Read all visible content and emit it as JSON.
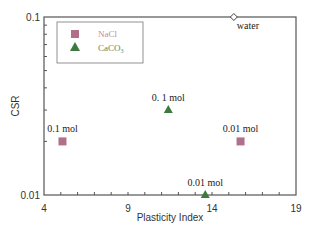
{
  "chart_data": {
    "type": "scatter",
    "title": "",
    "xlabel": "Plasticity Index",
    "ylabel": "CSR",
    "xlim": [
      4,
      19
    ],
    "ylim": [
      0.01,
      0.1
    ],
    "yscale": "log",
    "grid": false,
    "legend_position": "upper-left",
    "x_ticks": [
      4,
      9,
      14,
      19
    ],
    "x_tick_labels": [
      "4",
      "9",
      "14",
      "19"
    ],
    "y_ticks": [
      0.01,
      0.1
    ],
    "y_tick_labels": [
      "0.01",
      "0.1"
    ],
    "series": [
      {
        "name": "NaCl",
        "marker": "square",
        "color": "#b0708a",
        "points": [
          {
            "x": 5.1,
            "y": 0.02,
            "label": "0.1 mol"
          },
          {
            "x": 15.7,
            "y": 0.02,
            "label": "0.01 mol"
          }
        ]
      },
      {
        "name": "CaCO3",
        "marker": "triangle",
        "color": "#3d7a3d",
        "points": [
          {
            "x": 11.4,
            "y": 0.03,
            "label": "0. 1 mol"
          },
          {
            "x": 13.6,
            "y": 0.01,
            "label": "0.01 mol"
          }
        ]
      },
      {
        "name": "water",
        "marker": "diamond-open",
        "color": "#444444",
        "in_legend": false,
        "points": [
          {
            "x": 15.3,
            "y": 0.1,
            "label": "water"
          }
        ]
      }
    ]
  },
  "legend": {
    "nacl_label": "NaCl",
    "caco3_label": "CaCO",
    "caco3_sub": "3"
  }
}
